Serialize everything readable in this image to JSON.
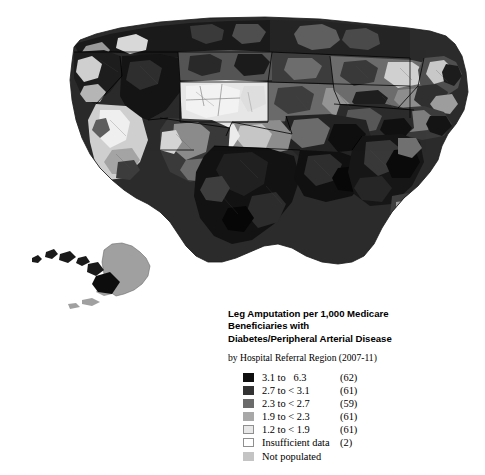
{
  "legend": {
    "title_lines": [
      "Leg Amputation per 1,000 Medicare",
      "Beneficiaries with",
      "Diabetes/Peripheral Arterial Disease"
    ],
    "subtitle": "by Hospital Referral Region (2007-11)",
    "rows": [
      {
        "label": "3.1 to   6.3",
        "count": "(62)",
        "color": "#0f0f0f"
      },
      {
        "label": "2.7 to < 3.1",
        "count": "(61)",
        "color": "#333333"
      },
      {
        "label": "2.3 to < 2.7",
        "count": "(59)",
        "color": "#6b6b6b"
      },
      {
        "label": "1.9 to < 2.3",
        "count": "(61)",
        "color": "#a8a8a8"
      },
      {
        "label": "1.2 to < 1.9",
        "count": "(61)",
        "color": "#e8e8e8"
      },
      {
        "label": "Insufficient data",
        "count": "(2)",
        "color": "#ffffff"
      },
      {
        "label": "Not populated",
        "count": "",
        "color": "#c4c4c4"
      }
    ]
  },
  "map": {
    "background": "#ffffff",
    "border_color": "#000000",
    "insets": [
      "hawaii",
      "alaska"
    ]
  },
  "chart_data": {
    "type": "choropleth",
    "title": "Leg Amputation per 1,000 Medicare Beneficiaries with Diabetes/Peripheral Arterial Disease",
    "subtitle": "by Hospital Referral Region (2007-11)",
    "unit": "amputations per 1,000 Medicare beneficiaries",
    "geography": "Hospital Referral Region (HRR), United States",
    "period": "2007-11",
    "legend_position": "bottom-right",
    "classes": [
      {
        "range_label": "3.1 to   6.3",
        "min": 3.1,
        "max": 6.3,
        "count": 62,
        "color": "#0f0f0f"
      },
      {
        "range_label": "2.7 to < 3.1",
        "min": 2.7,
        "max": 3.1,
        "count": 61,
        "color": "#333333"
      },
      {
        "range_label": "2.3 to < 2.7",
        "min": 2.3,
        "max": 2.7,
        "count": 59,
        "color": "#6b6b6b"
      },
      {
        "range_label": "1.9 to < 2.3",
        "min": 1.9,
        "max": 2.3,
        "count": 61,
        "color": "#a8a8a8"
      },
      {
        "range_label": "1.2 to < 1.9",
        "min": 1.2,
        "max": 1.9,
        "count": 61,
        "color": "#e8e8e8"
      },
      {
        "range_label": "Insufficient data",
        "min": null,
        "max": null,
        "count": 2,
        "color": "#ffffff"
      },
      {
        "range_label": "Not populated",
        "min": null,
        "max": null,
        "count": null,
        "color": "#c4c4c4"
      }
    ],
    "total_regions": 306,
    "regional_pattern": {
      "southeast": "predominantly highest class (3.1 to 6.3)",
      "south_central_texas": "predominantly highest class",
      "northwest": "mixed, many dark high-rate regions",
      "mountain_west": "many lowest class (1.2 to < 1.9)",
      "california_coast": "lower classes",
      "northeast": "mixed middle and low classes",
      "alaska": "mid class (not populated / 2.3 to < 2.7)",
      "hawaii": "highest class"
    }
  }
}
